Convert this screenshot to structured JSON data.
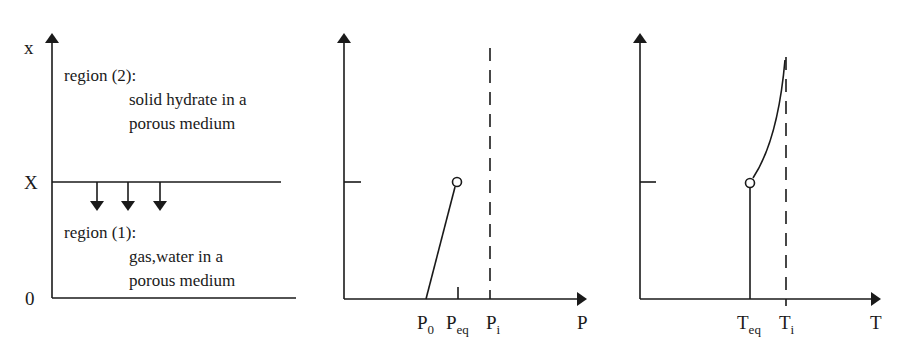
{
  "panel_left": {
    "y_axis_label": "x",
    "tick_front": "X",
    "tick_origin": "0",
    "region2": {
      "title": "region (2):",
      "line1": "solid hydrate in a",
      "line2": "porous medium"
    },
    "region1": {
      "title": "region (1):",
      "line1": "gas,water in a",
      "line2": "porous medium"
    },
    "front_arrows_count": 3
  },
  "panel_pressure": {
    "x_axis_label": "P",
    "ticks": [
      {
        "main": "P",
        "sub": "0"
      },
      {
        "main": "P",
        "sub": "eq"
      },
      {
        "main": "P",
        "sub": "i"
      }
    ],
    "curve": "linear rise from P0 at bottom to Peq at front (open circle)",
    "dashed_line_at": "Pi"
  },
  "panel_temperature": {
    "x_axis_label": "T",
    "ticks": [
      {
        "main": "T",
        "sub": "eq"
      },
      {
        "main": "T",
        "sub": "i"
      }
    ],
    "curve": "constant Teq below front, rising curve toward Ti above front",
    "dashed_line_at": "Ti"
  },
  "colors": {
    "ink": "#1a1a1a",
    "background": "#ffffff"
  }
}
